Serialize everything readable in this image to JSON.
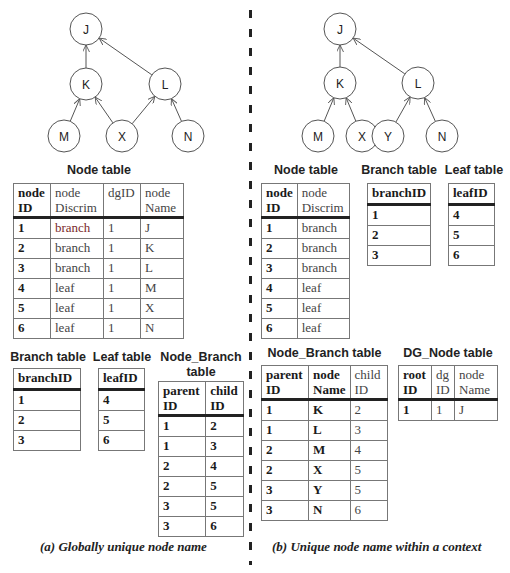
{
  "left": {
    "graph": {
      "nodes": [
        {
          "id": "J",
          "x": 86,
          "y": 29
        },
        {
          "id": "K",
          "x": 86,
          "y": 84
        },
        {
          "id": "L",
          "x": 165,
          "y": 84
        },
        {
          "id": "M",
          "x": 64,
          "y": 136
        },
        {
          "id": "X",
          "x": 122,
          "y": 136
        },
        {
          "id": "N",
          "x": 188,
          "y": 136
        }
      ],
      "edges": [
        [
          "K",
          "J"
        ],
        [
          "L",
          "J"
        ],
        [
          "M",
          "K"
        ],
        [
          "X",
          "K"
        ],
        [
          "X",
          "L"
        ],
        [
          "N",
          "L"
        ]
      ]
    },
    "node_table": {
      "title": "Node table",
      "headers": [
        "node ID",
        "node Discrim",
        "dgID",
        "node Name"
      ],
      "header_lines": [
        [
          "node",
          "ID"
        ],
        [
          "node",
          "Discrim"
        ],
        [
          "dgID",
          ""
        ],
        [
          "node",
          "Name"
        ]
      ],
      "rows": [
        [
          "1",
          "branch",
          "1",
          "J"
        ],
        [
          "2",
          "branch",
          "1",
          "K"
        ],
        [
          "3",
          "branch",
          "1",
          "L"
        ],
        [
          "4",
          "leaf",
          "1",
          "M"
        ],
        [
          "5",
          "leaf",
          "1",
          "X"
        ],
        [
          "6",
          "leaf",
          "1",
          "N"
        ]
      ]
    },
    "branch_table": {
      "title": "Branch table",
      "header": "branchID",
      "rows": [
        "1",
        "2",
        "3"
      ]
    },
    "leaf_table": {
      "title": "Leaf table",
      "header": "leafID",
      "rows": [
        "4",
        "5",
        "6"
      ]
    },
    "node_branch_table": {
      "title_line1": "Node_Branch",
      "title_line2": "table",
      "header_lines": [
        [
          "parent",
          "ID"
        ],
        [
          "child",
          "ID"
        ]
      ],
      "rows": [
        [
          "1",
          "2"
        ],
        [
          "1",
          "3"
        ],
        [
          "2",
          "4"
        ],
        [
          "2",
          "5"
        ],
        [
          "3",
          "5"
        ],
        [
          "3",
          "6"
        ]
      ]
    },
    "caption": "(a) Globally unique node name"
  },
  "right": {
    "graph": {
      "nodes": [
        {
          "id": "J",
          "x": 340,
          "y": 29
        },
        {
          "id": "K",
          "x": 340,
          "y": 83
        },
        {
          "id": "L",
          "x": 418,
          "y": 83
        },
        {
          "id": "M",
          "x": 318,
          "y": 136
        },
        {
          "id": "X",
          "x": 362,
          "y": 136
        },
        {
          "id": "Y",
          "x": 388,
          "y": 136
        },
        {
          "id": "N",
          "x": 442,
          "y": 136
        }
      ],
      "edges": [
        [
          "K",
          "J"
        ],
        [
          "L",
          "J"
        ],
        [
          "M",
          "K"
        ],
        [
          "X",
          "K"
        ],
        [
          "Y",
          "L"
        ],
        [
          "N",
          "L"
        ]
      ]
    },
    "node_table": {
      "title": "Node table",
      "header_lines": [
        [
          "node",
          "ID"
        ],
        [
          "node",
          "Discrim"
        ]
      ],
      "rows": [
        [
          "1",
          "branch"
        ],
        [
          "2",
          "branch"
        ],
        [
          "3",
          "branch"
        ],
        [
          "4",
          "leaf"
        ],
        [
          "5",
          "leaf"
        ],
        [
          "6",
          "leaf"
        ]
      ]
    },
    "branch_table": {
      "title": "Branch table",
      "header": "branchID",
      "rows": [
        "1",
        "2",
        "3"
      ]
    },
    "leaf_table": {
      "title": "Leaf table",
      "header": "leafID",
      "rows": [
        "4",
        "5",
        "6"
      ]
    },
    "node_branch_table": {
      "title": "Node_Branch table",
      "header_lines": [
        [
          "parent",
          "ID"
        ],
        [
          "node",
          "Name"
        ],
        [
          "child",
          "ID"
        ]
      ],
      "rows": [
        [
          "1",
          "K",
          "2"
        ],
        [
          "1",
          "L",
          "3"
        ],
        [
          "2",
          "M",
          "4"
        ],
        [
          "2",
          "X",
          "5"
        ],
        [
          "3",
          "Y",
          "5"
        ],
        [
          "3",
          "N",
          "6"
        ]
      ]
    },
    "dg_node_table": {
      "title": "DG_Node table",
      "header_lines": [
        [
          "root",
          "ID"
        ],
        [
          "dg",
          "ID"
        ],
        [
          "node",
          "Name"
        ]
      ],
      "rows": [
        [
          "1",
          "1",
          "J"
        ]
      ]
    },
    "caption": "(b) Unique node name within a context"
  }
}
